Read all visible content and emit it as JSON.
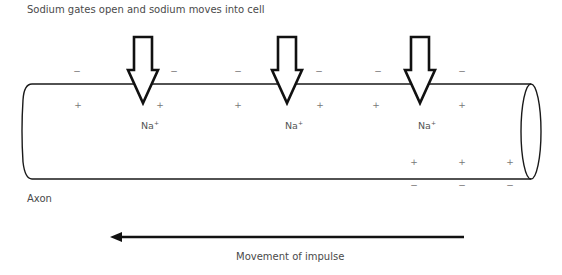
{
  "title": "Sodium gates open and sodium moves into cell",
  "axon_label": "Axon",
  "impulse_label": "Movement of impulse",
  "ion": {
    "symbol": "Na",
    "charge": "+"
  },
  "gates": [
    {
      "x": 143,
      "label": "Na",
      "charge": "+"
    },
    {
      "x": 287,
      "label": "Na",
      "charge": "+"
    },
    {
      "x": 420,
      "label": "Na",
      "charge": "+"
    }
  ],
  "charges": {
    "outside_top": [
      {
        "x": 77,
        "y": 71,
        "sign": "−"
      },
      {
        "x": 174,
        "y": 71,
        "sign": "−"
      },
      {
        "x": 238,
        "y": 71,
        "sign": "−"
      },
      {
        "x": 319,
        "y": 71,
        "sign": "−"
      },
      {
        "x": 378,
        "y": 71,
        "sign": "−"
      },
      {
        "x": 462,
        "y": 71,
        "sign": "−"
      }
    ],
    "inside_top": [
      {
        "x": 78,
        "y": 105,
        "sign": "+"
      },
      {
        "x": 160,
        "y": 105,
        "sign": "+"
      },
      {
        "x": 238,
        "y": 105,
        "sign": "+"
      },
      {
        "x": 320,
        "y": 105,
        "sign": "+"
      },
      {
        "x": 376,
        "y": 105,
        "sign": "+"
      },
      {
        "x": 462,
        "y": 105,
        "sign": "+"
      }
    ],
    "inside_bottom": [
      {
        "x": 414,
        "y": 162,
        "sign": "+"
      },
      {
        "x": 462,
        "y": 162,
        "sign": "+"
      },
      {
        "x": 510,
        "y": 162,
        "sign": "+"
      }
    ],
    "outside_bottom": [
      {
        "x": 414,
        "y": 185,
        "sign": "−"
      },
      {
        "x": 462,
        "y": 185,
        "sign": "−"
      },
      {
        "x": 510,
        "y": 185,
        "sign": "−"
      }
    ]
  },
  "impulse_direction": "left",
  "colors": {
    "stroke": "#1a1a1a",
    "text": "#4a4a4a",
    "charge": "#777777"
  }
}
